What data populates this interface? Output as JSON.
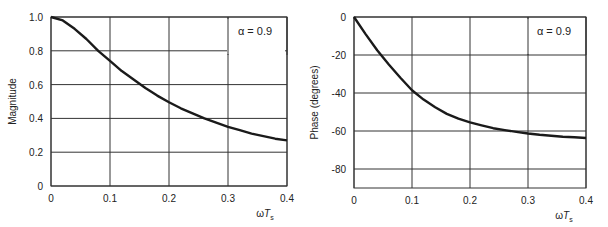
{
  "chart_data": [
    {
      "type": "line",
      "title": "",
      "annotation": "α = 0.9",
      "xlabel": "ωT",
      "xlabel_sub": "s",
      "ylabel": "Magnitude",
      "xlim": [
        0,
        0.4
      ],
      "ylim": [
        0,
        1.0
      ],
      "grid": true,
      "xticks": [
        "0",
        "0.1",
        "0.2",
        "0.3",
        "0.4"
      ],
      "yticks": [
        "0",
        "0.2",
        "0.4",
        "0.6",
        "0.8",
        "1.0"
      ],
      "x": [
        0,
        0.02,
        0.04,
        0.06,
        0.08,
        0.1,
        0.12,
        0.14,
        0.16,
        0.18,
        0.2,
        0.22,
        0.24,
        0.26,
        0.28,
        0.3,
        0.32,
        0.34,
        0.36,
        0.38,
        0.4
      ],
      "series": [
        {
          "name": "Magnitude",
          "values": [
            1.0,
            0.98,
            0.93,
            0.87,
            0.8,
            0.74,
            0.68,
            0.63,
            0.58,
            0.535,
            0.495,
            0.46,
            0.43,
            0.4,
            0.375,
            0.35,
            0.33,
            0.31,
            0.295,
            0.28,
            0.27
          ]
        }
      ]
    },
    {
      "type": "line",
      "title": "",
      "annotation": "α = 0.9",
      "xlabel": "ωT",
      "xlabel_sub": "s",
      "ylabel": "Phase  (degrees)",
      "xlim": [
        0,
        0.4
      ],
      "ylim": [
        -90,
        0
      ],
      "grid": true,
      "xticks": [
        "0",
        "0.1",
        "0.2",
        "0.3",
        "0.4"
      ],
      "yticks": [
        "0",
        "-20",
        "-40",
        "-60",
        "-80"
      ],
      "x": [
        0,
        0.02,
        0.04,
        0.06,
        0.08,
        0.1,
        0.12,
        0.14,
        0.16,
        0.18,
        0.2,
        0.22,
        0.24,
        0.26,
        0.28,
        0.3,
        0.32,
        0.34,
        0.36,
        0.38,
        0.4
      ],
      "series": [
        {
          "name": "Phase",
          "values": [
            0,
            -9,
            -17.5,
            -25,
            -32,
            -38.5,
            -43.5,
            -47.5,
            -51,
            -53.5,
            -55.5,
            -57,
            -58.5,
            -59.5,
            -60.5,
            -61.3,
            -62,
            -62.5,
            -63,
            -63.3,
            -63.7
          ]
        }
      ]
    }
  ]
}
